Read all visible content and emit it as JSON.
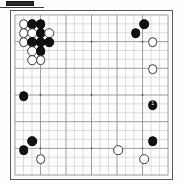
{
  "figure": {
    "label_chip": "",
    "type": "go-board-diagram",
    "board_size": 19,
    "colors": {
      "black_stone": "#111111",
      "white_stone": "#ffffff",
      "grid_line": "#9a9a9a",
      "board_border": "#5a5a5a",
      "board_background": "#fdfdfd",
      "label_chip": "#2b2b2b"
    }
  },
  "board": {
    "size": 19,
    "star_points": [
      {
        "col": 4,
        "row": 4
      },
      {
        "col": 10,
        "row": 4
      },
      {
        "col": 16,
        "row": 4
      },
      {
        "col": 4,
        "row": 10
      },
      {
        "col": 10,
        "row": 10
      },
      {
        "col": 16,
        "row": 10
      },
      {
        "col": 4,
        "row": 16
      },
      {
        "col": 10,
        "row": 16
      },
      {
        "col": 16,
        "row": 16
      }
    ],
    "stones": [
      {
        "col": 2,
        "row": 2,
        "color": "white",
        "label": ""
      },
      {
        "col": 3,
        "row": 2,
        "color": "black",
        "label": ""
      },
      {
        "col": 4,
        "row": 2,
        "color": "black",
        "label": ""
      },
      {
        "col": 2,
        "row": 3,
        "color": "white",
        "label": ""
      },
      {
        "col": 3,
        "row": 3,
        "color": "white",
        "label": ""
      },
      {
        "col": 4,
        "row": 3,
        "color": "black",
        "label": ""
      },
      {
        "col": 5,
        "row": 3,
        "color": "white",
        "label": ""
      },
      {
        "col": 2,
        "row": 4,
        "color": "white",
        "label": ""
      },
      {
        "col": 3,
        "row": 4,
        "color": "black",
        "label": ""
      },
      {
        "col": 4,
        "row": 4,
        "color": "black",
        "label": ""
      },
      {
        "col": 5,
        "row": 4,
        "color": "black",
        "label": ""
      },
      {
        "col": 3,
        "row": 5,
        "color": "white",
        "label": ""
      },
      {
        "col": 4,
        "row": 5,
        "color": "black",
        "label": ""
      },
      {
        "col": 3,
        "row": 6,
        "color": "white",
        "label": ""
      },
      {
        "col": 4,
        "row": 6,
        "color": "white",
        "label": ""
      },
      {
        "col": 15,
        "row": 3,
        "color": "black",
        "label": ""
      },
      {
        "col": 16,
        "row": 2,
        "color": "black",
        "label": ""
      },
      {
        "col": 17,
        "row": 4,
        "color": "white",
        "label": ""
      },
      {
        "col": 17,
        "row": 7,
        "color": "white",
        "label": ""
      },
      {
        "col": 2,
        "row": 10,
        "color": "black",
        "label": ""
      },
      {
        "col": 17,
        "row": 11,
        "color": "black",
        "label": "1"
      },
      {
        "col": 3,
        "row": 15,
        "color": "black",
        "label": ""
      },
      {
        "col": 2,
        "row": 16,
        "color": "black",
        "label": ""
      },
      {
        "col": 4,
        "row": 17,
        "color": "white",
        "label": ""
      },
      {
        "col": 17,
        "row": 15,
        "color": "black",
        "label": ""
      },
      {
        "col": 13,
        "row": 16,
        "color": "white",
        "label": ""
      },
      {
        "col": 16,
        "row": 17,
        "color": "white",
        "label": ""
      }
    ]
  }
}
